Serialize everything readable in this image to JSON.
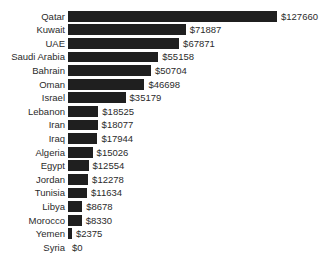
{
  "chart_data": {
    "type": "bar",
    "orientation": "horizontal",
    "title": "",
    "subtitle": "",
    "xlabel": "",
    "ylabel": "",
    "grid": false,
    "legend": null,
    "axis_visible": false,
    "value_prefix": "$",
    "xlim": [
      0,
      127660
    ],
    "categories": [
      "Qatar",
      "Kuwait",
      "UAE",
      "Saudi Arabia",
      "Bahrain",
      "Oman",
      "Israel",
      "Lebanon",
      "Iran",
      "Iraq",
      "Algeria",
      "Egypt",
      "Jordan",
      "Tunisia",
      "Libya",
      "Morocco",
      "Yemen",
      "Syria"
    ],
    "values": [
      127660,
      71887,
      67871,
      55158,
      50704,
      46698,
      35179,
      18525,
      18077,
      17944,
      15026,
      12554,
      12278,
      11634,
      8678,
      8330,
      2375,
      0
    ],
    "data_labels": [
      "$127660",
      "$71887",
      "$67871",
      "$55158",
      "$50704",
      "$46698",
      "$35179",
      "$18525",
      "$18077",
      "$17944",
      "$15026",
      "$12554",
      "$12278",
      "$11634",
      "$8678",
      "$8330",
      "$2375",
      "$0"
    ],
    "bars": [
      {
        "label": "Qatar",
        "value": 127660,
        "data_label": "$127660"
      },
      {
        "label": "Kuwait",
        "value": 71887,
        "data_label": "$71887"
      },
      {
        "label": "UAE",
        "value": 67871,
        "data_label": "$67871"
      },
      {
        "label": "Saudi Arabia",
        "value": 55158,
        "data_label": "$55158"
      },
      {
        "label": "Bahrain",
        "value": 50704,
        "data_label": "$50704"
      },
      {
        "label": "Oman",
        "value": 46698,
        "data_label": "$46698"
      },
      {
        "label": "Israel",
        "value": 35179,
        "data_label": "$35179"
      },
      {
        "label": "Lebanon",
        "value": 18525,
        "data_label": "$18525"
      },
      {
        "label": "Iran",
        "value": 18077,
        "data_label": "$18077"
      },
      {
        "label": "Iraq",
        "value": 17944,
        "data_label": "$17944"
      },
      {
        "label": "Algeria",
        "value": 15026,
        "data_label": "$15026"
      },
      {
        "label": "Egypt",
        "value": 12554,
        "data_label": "$12554"
      },
      {
        "label": "Jordan",
        "value": 12278,
        "data_label": "$12278"
      },
      {
        "label": "Tunisia",
        "value": 11634,
        "data_label": "$11634"
      },
      {
        "label": "Libya",
        "value": 8678,
        "data_label": "$8678"
      },
      {
        "label": "Morocco",
        "value": 8330,
        "data_label": "$8330"
      },
      {
        "label": "Yemen",
        "value": 2375,
        "data_label": "$2375"
      },
      {
        "label": "Syria",
        "value": 0,
        "data_label": "$0"
      }
    ],
    "colors": {
      "bar": "#1f1f1f",
      "background": "#ffffff",
      "text": "#2b2b2b"
    }
  },
  "layout": {
    "label_right_edge": 65,
    "bar_start_x": 68,
    "max_bar_width": 209,
    "row_height": 13.6,
    "bar_height": 10.8,
    "first_row_top": 9.5,
    "value_gap": 4
  }
}
